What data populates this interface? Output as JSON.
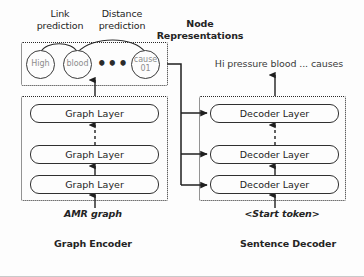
{
  "figure": {
    "background": "#fdfdfd",
    "line_color": "#2a2a2a",
    "node_text_color": "#8d8d8d"
  },
  "annotations": {
    "link_prediction": "Link\nprediction",
    "distance_prediction": "Distance\nprediction",
    "node_representations": "Node\nRepresentations"
  },
  "nodes": [
    {
      "id": "high",
      "label": "High"
    },
    {
      "id": "blood",
      "label": "blood"
    },
    {
      "id": "ellipsis",
      "label": "•••"
    },
    {
      "id": "cause",
      "label_line1": "cause",
      "label_line2": "01"
    }
  ],
  "encoder": {
    "group_label": "Graph Encoder",
    "input_label": "AMR graph",
    "layers": [
      {
        "label": "Graph Layer"
      },
      {
        "label": "Graph Layer"
      },
      {
        "label": "Graph Layer"
      }
    ]
  },
  "decoder": {
    "group_label": "Sentence Decoder",
    "input_label": "<Start token>",
    "output_label": "Hi pressure blood ... causes",
    "layers": [
      {
        "label": "Decoder Layer"
      },
      {
        "label": "Decoder Layer"
      },
      {
        "label": "Decoder Layer"
      }
    ]
  }
}
